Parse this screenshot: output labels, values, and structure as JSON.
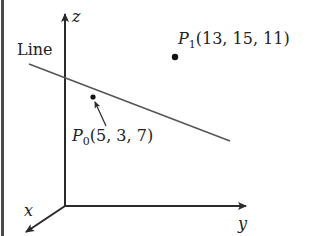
{
  "diagram": {
    "type": "3d-coordinate-line",
    "axes": {
      "x_label": "x",
      "y_label": "y",
      "z_label": "z"
    },
    "line_label": "Line",
    "points": [
      {
        "name": "P",
        "subscript": "0",
        "coords_text": "(5, 3, 7)",
        "on_line": true
      },
      {
        "name": "P",
        "subscript": "1",
        "coords_text": "(13, 15, 11)",
        "on_line": false
      }
    ],
    "colors": {
      "axis": "#2a2a2a",
      "line": "#555555",
      "point": "#111111",
      "border": "#4a4a4a"
    }
  }
}
